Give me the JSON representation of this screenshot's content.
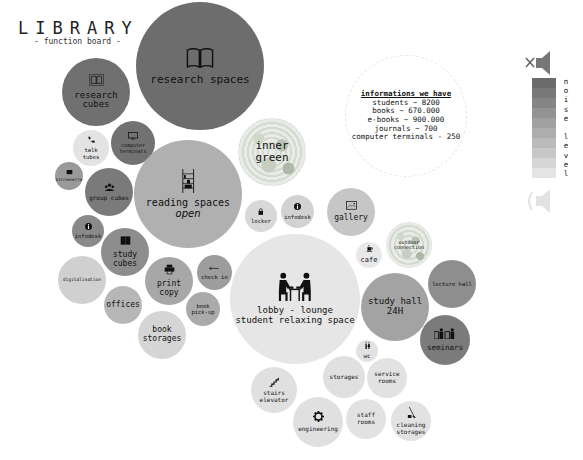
{
  "header": {
    "title": "LIBRARY",
    "subtitle": "- function board -"
  },
  "info": {
    "heading": "informations we have",
    "lines": [
      "students ~ 8200",
      "books ~ 670.000",
      "e-books ~ 900.000",
      "journals ~ 700",
      "computer terminals - 250"
    ]
  },
  "legend": {
    "label": "noise level",
    "top_icon": "speaker-muted-icon",
    "bottom_icon": "speaker-sound-icon",
    "colors": [
      "#6b6b6b",
      "#787878",
      "#858585",
      "#939393",
      "#a0a0a0",
      "#adadad",
      "#bbbbbb",
      "#c8c8c8",
      "#d6d6d6",
      "#e4e4e4"
    ]
  },
  "bubbles": [
    {
      "id": "research-spaces",
      "label": "research spaces",
      "icon": "open-book-icon",
      "x": 136,
      "y": 2,
      "d": 128,
      "color": "#6d6d6d",
      "fs": 11
    },
    {
      "id": "research-cubes",
      "label": "research\ncubes",
      "icon": "book-icon",
      "x": 62,
      "y": 58,
      "d": 68,
      "color": "#707070",
      "fs": 9
    },
    {
      "id": "talk-tubes",
      "label": "talk\ntubes",
      "icon": "phone-icon",
      "x": 73,
      "y": 130,
      "d": 36,
      "color": "#e3e3e3",
      "fs": 5.5
    },
    {
      "id": "computer-terminals",
      "label": "computer\nterminals",
      "icon": "monitor-icon",
      "x": 111,
      "y": 121,
      "d": 44,
      "color": "#727272",
      "fs": 5
    },
    {
      "id": "kitchenette",
      "label": "kitchenette",
      "icon": "cup-icon",
      "x": 55,
      "y": 162,
      "d": 28,
      "color": "#9a9a9a",
      "fs": 4
    },
    {
      "id": "group-cubes",
      "label": "group cubes",
      "icon": "group-icon",
      "x": 85,
      "y": 168,
      "d": 48,
      "color": "#7a7a7a",
      "fs": 6
    },
    {
      "id": "reading-spaces",
      "label": "reading spaces",
      "sub": "open",
      "icon": "bookshelf-ladder-icon",
      "x": 134,
      "y": 140,
      "d": 108,
      "color": "#b0b0b0",
      "fs": 10
    },
    {
      "id": "inner-green",
      "label": "inner\ngreen",
      "icon": "",
      "x": 238,
      "y": 118,
      "d": 68,
      "color": "green",
      "fs": 11
    },
    {
      "id": "infodesk-left",
      "label": "infodesk",
      "icon": "info-icon",
      "x": 72,
      "y": 215,
      "d": 32,
      "color": "#8a8a8a",
      "fs": 5.5
    },
    {
      "id": "study-cubes",
      "label": "study\ncubes",
      "icon": "cubes-icon",
      "x": 101,
      "y": 228,
      "d": 48,
      "color": "#8d8d8d",
      "fs": 8
    },
    {
      "id": "locker",
      "label": "locker",
      "icon": "lock-icon",
      "x": 245,
      "y": 200,
      "d": 32,
      "color": "#d8d8d8",
      "fs": 5.5
    },
    {
      "id": "infodesk-center",
      "label": "infodesk",
      "icon": "info-icon",
      "x": 281,
      "y": 195,
      "d": 33,
      "color": "#d2d2d2",
      "fs": 5.5
    },
    {
      "id": "gallery",
      "label": "gallery",
      "icon": "image-icon",
      "x": 327,
      "y": 188,
      "d": 48,
      "color": "#c6c6c6",
      "fs": 8
    },
    {
      "id": "digitalisation",
      "label": "digitalisation",
      "icon": "",
      "x": 58,
      "y": 256,
      "d": 48,
      "color": "#d0d0d0",
      "fs": 4.5
    },
    {
      "id": "print-copy",
      "label": "print\ncopy",
      "icon": "printer-icon",
      "x": 145,
      "y": 257,
      "d": 48,
      "color": "#a7a7a7",
      "fs": 8
    },
    {
      "id": "check-in",
      "label": "check in",
      "icon": "arrow-left-icon",
      "x": 197,
      "y": 255,
      "d": 35,
      "color": "#9d9d9d",
      "fs": 5.5
    },
    {
      "id": "offices",
      "label": "offices",
      "icon": "",
      "x": 104,
      "y": 286,
      "d": 38,
      "color": "#b7b7b7",
      "fs": 8
    },
    {
      "id": "book-pickup",
      "label": "book\npick-up",
      "icon": "",
      "x": 186,
      "y": 292,
      "d": 34,
      "color": "#aaaaaa",
      "fs": 5.5
    },
    {
      "id": "book-storages",
      "label": "book\nstorages",
      "icon": "",
      "x": 138,
      "y": 311,
      "d": 48,
      "color": "#d5d5d5",
      "fs": 8
    },
    {
      "id": "lobby-lounge",
      "label": "lobby - lounge\nstudent relaxing space",
      "icon": "meeting-people-icon",
      "x": 230,
      "y": 234,
      "d": 130,
      "color": "#e6e6e6",
      "fs": 9
    },
    {
      "id": "cafe",
      "label": "cafe",
      "icon": "coffee-icon",
      "x": 356,
      "y": 242,
      "d": 26,
      "color": "#e8e8e8",
      "fs": 7
    },
    {
      "id": "outdoor-connection",
      "label": "outdoor\nconnection",
      "icon": "",
      "x": 386,
      "y": 222,
      "d": 46,
      "color": "green",
      "fs": 5
    },
    {
      "id": "lecture-hall",
      "label": "lecture hall",
      "icon": "",
      "x": 428,
      "y": 260,
      "d": 48,
      "color": "#8e8e8e",
      "fs": 5.5
    },
    {
      "id": "study-hall",
      "label": "study hall\n24H",
      "icon": "",
      "x": 361,
      "y": 273,
      "d": 68,
      "color": "#a3a3a3",
      "fs": 9
    },
    {
      "id": "seminars",
      "label": "seminars",
      "icon": "presenter-icon",
      "x": 420,
      "y": 315,
      "d": 50,
      "color": "#7b7b7b",
      "fs": 7.5
    },
    {
      "id": "wc",
      "label": "wc",
      "icon": "restroom-icon",
      "x": 356,
      "y": 340,
      "d": 22,
      "color": "#e2e2e2",
      "fs": 6
    },
    {
      "id": "stairs-elevator",
      "label": "stairs\nelevator",
      "icon": "stairs-icon",
      "x": 251,
      "y": 367,
      "d": 46,
      "color": "#e0e0e0",
      "fs": 6
    },
    {
      "id": "storages",
      "label": "storages",
      "icon": "",
      "x": 323,
      "y": 356,
      "d": 42,
      "color": "#e0e0e0",
      "fs": 6
    },
    {
      "id": "service-rooms",
      "label": "service\nrooms",
      "icon": "",
      "x": 367,
      "y": 358,
      "d": 40,
      "color": "#e2e2e2",
      "fs": 6
    },
    {
      "id": "engineering",
      "label": "engineering",
      "icon": "gear-icon",
      "x": 293,
      "y": 397,
      "d": 50,
      "color": "#e0e0e0",
      "fs": 6
    },
    {
      "id": "staff-rooms",
      "label": "staff\nrooms",
      "icon": "",
      "x": 346,
      "y": 399,
      "d": 40,
      "color": "#e2e2e2",
      "fs": 6
    },
    {
      "id": "cleaning-storages",
      "label": "cleaning\nstorages",
      "icon": "broom-icon",
      "x": 391,
      "y": 401,
      "d": 40,
      "color": "#e2e2e2",
      "fs": 6
    }
  ]
}
